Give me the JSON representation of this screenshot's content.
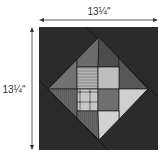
{
  "diagram": {
    "width_label": "13¼\"",
    "height_label": "13¼\"",
    "colors": {
      "background": "#2b2b2b",
      "seam": "#1a1a1a",
      "dimension_line": "#333333",
      "top_left_triangle": "#727272",
      "top_cell_left": "#6b6b6b",
      "top_cell_right": "#4c4c4c",
      "top_right_triangle": "#575757",
      "mid_upper_left": "#9c9c9c",
      "mid_upper_right": "#bdbdbd",
      "mid_lower_left": "#c6c6c6",
      "plaid_dark": "#6a6a6a",
      "mid_lower_right": "#6f6f6f",
      "bottom_left_triangle": "#676767",
      "bottom_right_triangle": "#cfcfcf",
      "bottom_cell_left": "#676767",
      "bottom_cell_right": "#d2d2d2"
    }
  }
}
